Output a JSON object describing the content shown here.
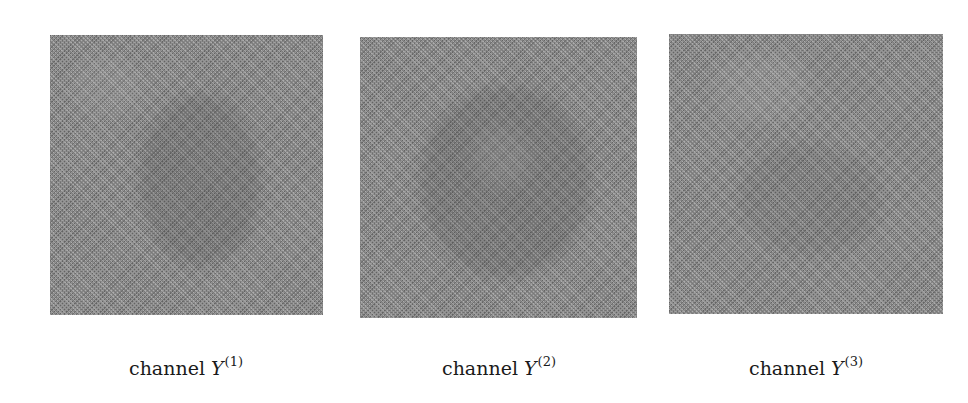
{
  "figure": {
    "panels": [
      {
        "id": "channel-1",
        "image_description": "grayscale noise-like channel image with faint diagonal lattice texture",
        "caption": {
          "prefix": "channel ",
          "variable": "Y",
          "superscript": "(1)"
        }
      },
      {
        "id": "channel-2",
        "image_description": "grayscale noise-like channel image with faint diagonal lattice texture",
        "caption": {
          "prefix": "channel ",
          "variable": "Y",
          "superscript": "(2)"
        }
      },
      {
        "id": "channel-3",
        "image_description": "grayscale noise-like channel image with faint horizontal/diagonal lattice texture",
        "caption": {
          "prefix": "channel ",
          "variable": "Y",
          "superscript": "(3)"
        }
      }
    ]
  },
  "colors": {
    "background": "#ffffff",
    "image_gray": "#8a8a8a",
    "text": "#1a1a1a"
  }
}
